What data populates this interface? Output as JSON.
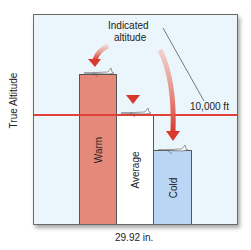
{
  "diagram": {
    "y_axis_label": "True Altitude",
    "x_axis_label": "29.92 in.",
    "annotation_top": [
      "Indicated",
      "altitude"
    ],
    "reference_line_label": "10,000 ft",
    "reference_line_color": "#e0403a",
    "background_color": "#eaf6fb",
    "arrow_color": "#de4a3c",
    "bars": [
      {
        "label": "Warm",
        "color": "#e58a7a",
        "relative_height": "above 10,000 ft"
      },
      {
        "label": "Average",
        "color": "#ffffff",
        "relative_height": "at 10,000 ft"
      },
      {
        "label": "Cold",
        "color": "#b9d6f4",
        "relative_height": "below 10,000 ft"
      }
    ],
    "airplane_icon": "airplane-icon"
  }
}
